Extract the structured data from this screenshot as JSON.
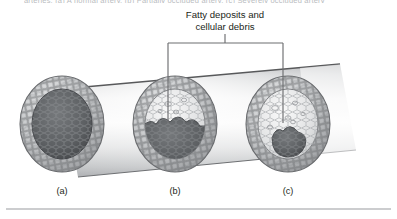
{
  "figure": {
    "type": "medical-illustration",
    "cut_off_header": "arteries. (a) A normal artery. (b) Partially occluded artery. (c) Severely occluded artery",
    "callout": {
      "line1": "Fatty deposits and",
      "line2": "cellular debris"
    },
    "panels": [
      {
        "id": "a",
        "label": "(a)",
        "state": "open lumen, no plaque",
        "plaque_fraction": 0.0
      },
      {
        "id": "b",
        "label": "(b)",
        "state": "partially occluded by plaque",
        "plaque_fraction": 0.5
      },
      {
        "id": "c",
        "label": "(c)",
        "state": "severely occluded by plaque",
        "plaque_fraction": 0.82
      }
    ],
    "colors": {
      "tube_light": "#f2f2f2",
      "tube_mid": "#d0d1d3",
      "tube_dark": "#a8aaad",
      "wall_weave": "#6f7174",
      "wall_light": "#cfd1d3",
      "lumen_dark": "#5a5c5f",
      "plaque_light": "#e4e5e6",
      "callout_line": "#6d6e71",
      "text": "#231f20",
      "rule": "#9a9c9f",
      "background": "#ffffff"
    }
  }
}
